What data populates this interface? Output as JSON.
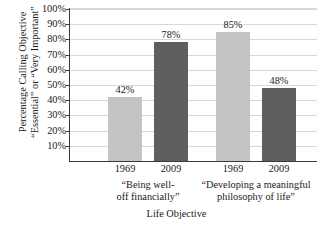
{
  "chart_data": {
    "type": "bar",
    "title": "",
    "xlabel": "Life Objective",
    "ylabel_line1": "Percentage Calling Objective",
    "ylabel_line2": "“Essential” or “Very Important”",
    "categories": [
      "1969",
      "2009",
      "1969",
      "2009"
    ],
    "values": [
      42,
      78,
      85,
      48
    ],
    "value_labels": [
      "42%",
      "78%",
      "85%",
      "48%"
    ],
    "bar_colors": [
      "#c4c4c4",
      "#5f5f5f",
      "#c4c4c4",
      "#5f5f5f"
    ],
    "groups": [
      {
        "label_line1": "“Being well-",
        "label_line2": "off financially”",
        "bars": [
          {
            "category": "1969",
            "value": 42,
            "label": "42%",
            "color": "#c4c4c4"
          },
          {
            "category": "2009",
            "value": 78,
            "label": "78%",
            "color": "#5f5f5f"
          }
        ]
      },
      {
        "label_line1": "“Developing a meaningful",
        "label_line2": "philosophy of life”",
        "bars": [
          {
            "category": "1969",
            "value": 85,
            "label": "85%",
            "color": "#c4c4c4"
          },
          {
            "category": "2009",
            "value": 48,
            "label": "48%",
            "color": "#5f5f5f"
          }
        ]
      }
    ],
    "ylim": [
      0,
      100
    ],
    "ytick_values": [
      100,
      90,
      80,
      70,
      60,
      50,
      40,
      30,
      20,
      10
    ],
    "ytick_labels": [
      "100%",
      "90%",
      "80%",
      "70%",
      "60%",
      "50%",
      "40%",
      "30%",
      "20%",
      "10%"
    ],
    "grid": true,
    "grid_color": "#d8d8d8",
    "axis_color": "#3a3a3a",
    "legend": "none",
    "legend_position": "none",
    "background": "#ffffff"
  }
}
